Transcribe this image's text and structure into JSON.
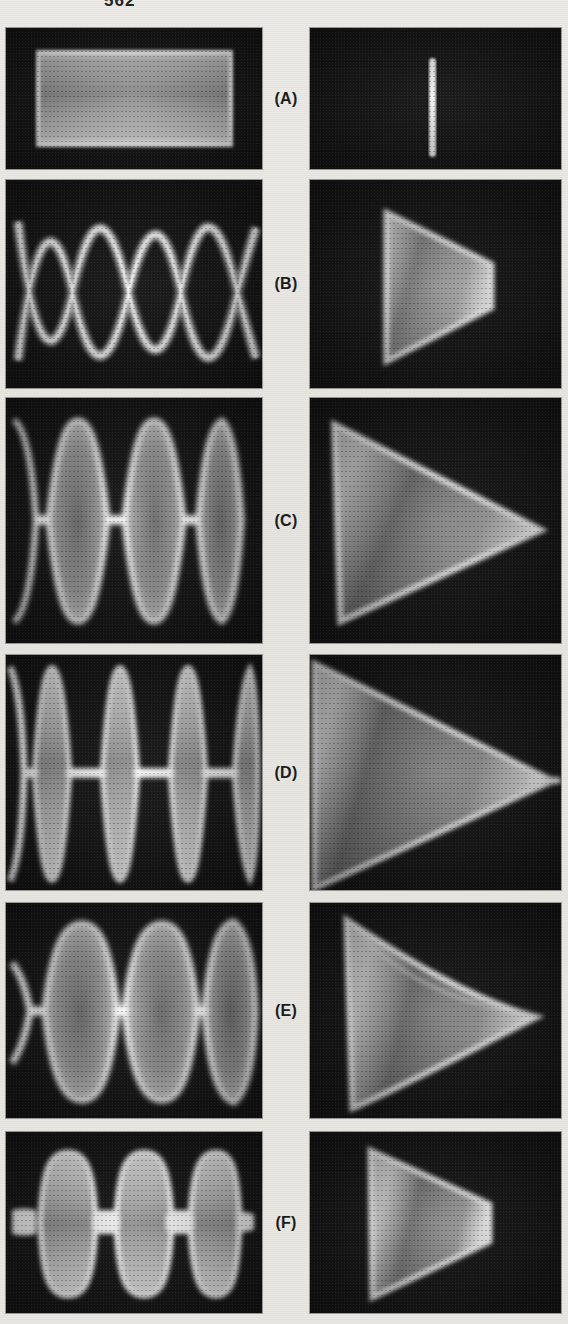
{
  "page": {
    "number": "562",
    "background_color": "#e9e7e3",
    "panel_color": "#161616",
    "trace_color": "#ffffff"
  },
  "figure": {
    "kind": "oscilloscope-photograph-plate",
    "columns": 2,
    "rows": 6,
    "left_column_caption": "eye-diagram / time-domain waveform",
    "right_column_caption": "vector / phase-trajectory pattern"
  },
  "rows": [
    {
      "label": "(A)",
      "top": 28,
      "height": 141,
      "left": {
        "name": "panel-a-left",
        "pattern": "rectangle",
        "description": "Bright rectangular block - fully open eye, no transitions",
        "eyes": 0
      },
      "right": {
        "name": "panel-a-right",
        "pattern": "vertical-bar",
        "description": "Single narrow vertical bright line centered in frame",
        "vertices": 0
      }
    },
    {
      "label": "(B)",
      "top": 180,
      "height": 208,
      "left": {
        "name": "panel-b-left",
        "pattern": "sinusoidal-eye",
        "description": "Smooth sinusoid-like eye diagram with 3 crossings and rounded X nodes",
        "eyes": 3
      },
      "right": {
        "name": "panel-b-right",
        "pattern": "truncated-triangle",
        "description": "Triangle pointing right with blunt flat tip",
        "vertices": 4
      }
    },
    {
      "label": "(C)",
      "top": 398,
      "height": 245,
      "left": {
        "name": "panel-c-left",
        "pattern": "lens-eye",
        "description": "Lens/ellipse-shaped eye openings with sharp crossing points",
        "eyes": 3
      },
      "right": {
        "name": "panel-c-right",
        "pattern": "triangle",
        "description": "Large triangle pointing right with sharp apex",
        "vertices": 3
      }
    },
    {
      "label": "(D)",
      "top": 655,
      "height": 235,
      "left": {
        "name": "panel-d-left",
        "pattern": "narrow-lens-eye",
        "description": "Tall narrow vertical lens shapes joined by thin horizontal bridges",
        "eyes": 3
      },
      "right": {
        "name": "panel-d-right",
        "pattern": "triangle-with-tail",
        "description": "Large filled triangle with a thin horizontal tail from the apex",
        "vertices": 3
      }
    },
    {
      "label": "(E)",
      "top": 903,
      "height": 215,
      "left": {
        "name": "panel-e-left",
        "pattern": "rounded-eye",
        "description": "Three rounded eye openings with pinched narrow crossings",
        "eyes": 3
      },
      "right": {
        "name": "panel-e-right",
        "pattern": "curved-triangle",
        "description": "Triangle with concave upper edge tapering to a fine point",
        "vertices": 3
      }
    },
    {
      "label": "(F)",
      "top": 1132,
      "height": 181,
      "left": {
        "name": "panel-f-left",
        "pattern": "flat-top-eye",
        "description": "Three flat-topped square-ish eye openings with wide bridges",
        "eyes": 3
      },
      "right": {
        "name": "panel-f-right",
        "pattern": "blunt-triangle",
        "description": "Small triangle pointing right with flat truncated tip",
        "vertices": 4
      }
    }
  ]
}
